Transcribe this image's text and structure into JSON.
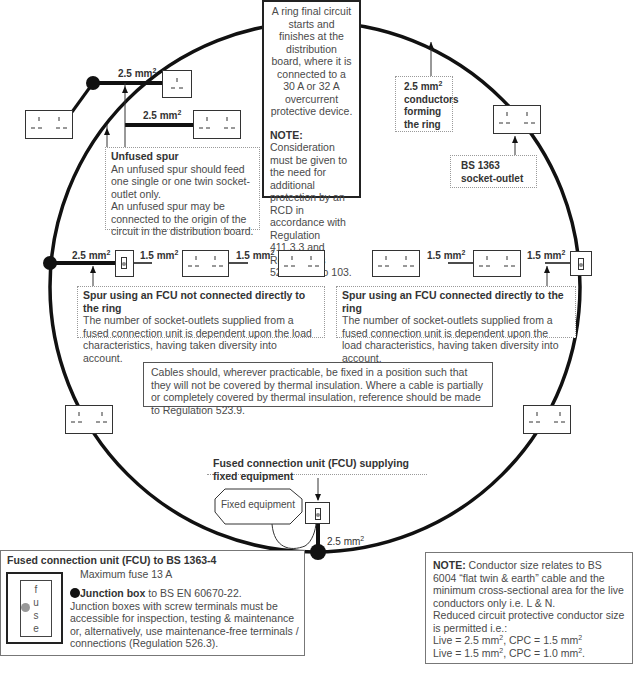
{
  "ring": {
    "description": "A ring final circuit starts and finishes at the distribution board, where it is connected to a 30 A or 32 A overcurrent protective device.",
    "note_label": "NOTE:",
    "note_text": " Consideration must be given to the need for additional protection by an RCD in accordance with Regulation 411.3.3 and Regulations 522.6.101 to 103."
  },
  "conductors_label": {
    "size": "2.5 mm",
    "sup": "2",
    "text": "conductors forming the ring"
  },
  "socket_outlet_label": {
    "line1": "BS 1363",
    "line2": "socket-outlet"
  },
  "unfused_spur": {
    "title": "Unfused spur",
    "text1": "An unfused spur should feed one single or one twin socket-outlet only.",
    "text2": "An unfused spur may be connected to the origin of the circuit in the distribution board.",
    "cable_top": "2.5 mm",
    "cable_lower": "2.5 mm",
    "sup": "2"
  },
  "spur_not_connected": {
    "title": "Spur using an FCU not connected directly to the ring",
    "text": "The number of socket-outlets supplied from a fused connection unit is dependent upon the load characteristics, having taken diversity into account.",
    "cables": [
      "2.5 mm",
      "1.5 mm",
      "1.5 mm"
    ],
    "sup": "2"
  },
  "spur_connected": {
    "title": "Spur using an FCU connected directly to the ring",
    "text": "The number of socket-outlets supplied from a fused connection unit is dependent upon the load characteristics, having taken diversity into account.",
    "cables": [
      "1.5 mm",
      "1.5 mm"
    ],
    "sup": "2"
  },
  "thermal_note": "Cables should, wherever practicable, be fixed in a position such that they will not be covered by thermal insulation. Where a cable is partially or completely covered by thermal insulation, reference should be made to Regulation 523.9.",
  "fixed_equipment": {
    "fcu_label": "Fused connection unit (FCU) supplying fixed equipment",
    "equipment_label": "Fixed equipment",
    "cable": "2.5 mm",
    "sup": "2"
  },
  "legend": {
    "fcu_title": "Fused connection unit (FCU) to BS 1363-4",
    "max_fuse": "Maximum fuse 13 A",
    "fuse_letters": [
      "f",
      "u",
      "s",
      "e"
    ],
    "junction_title": "Junction box",
    "junction_std": " to BS EN 60670-22.",
    "junction_text": "Junction boxes with screw terminals must be accessible for inspection, testing & maintenance or, alternatively, use maintenance-free terminals / connections (Regulation 526.3)."
  },
  "conductor_note": {
    "label": "NOTE:",
    "text": " Conductor size relates to BS 6004 “flat twin & earth” cable and the minimum cross-sectional area for the live conductors only i.e. L & N.",
    "text2": "Reduced circuit protective conductor size is permitted i.e.:",
    "live1": "Live = 2.5 mm",
    "cpc1": ", CPC = 1.5 mm",
    "live2": "Live = 1.5 mm",
    "cpc2": ", CPC = 1.0 mm",
    "end2": ".",
    "sup": "2"
  },
  "colors": {
    "ring_stroke": "#111111",
    "text": "#4a4a4a",
    "dotted_border": "#9a9a9a",
    "fuse_dot": "#888888"
  }
}
